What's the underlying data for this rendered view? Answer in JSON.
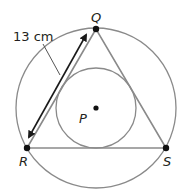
{
  "diagram": {
    "points": {
      "Q": {
        "label": "Q"
      },
      "R": {
        "label": "R"
      },
      "S": {
        "label": "S"
      },
      "P": {
        "label": "P"
      }
    },
    "measurement": {
      "label": "13 cm",
      "side": "RQ"
    },
    "colors": {
      "circle_stroke": "#8a8a8a",
      "triangle_stroke": "#8a8a8a",
      "point_fill": "#111111",
      "arrow": "#1a1a1a",
      "text": "#231f20"
    }
  }
}
